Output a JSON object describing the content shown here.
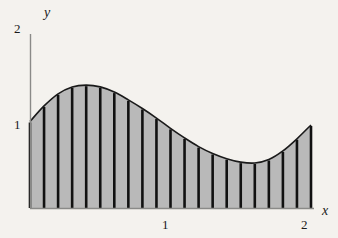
{
  "figure": {
    "background_color": "#f4f2ee",
    "axis_color": "#8a8a88",
    "curve_color": "#1a1a1a",
    "fill_color": "#b9b9b9",
    "strip_color": "#111111"
  },
  "axes": {
    "y_axis": {
      "variable_label": "y",
      "tick_labels": [
        "2",
        "1"
      ],
      "tick_values": [
        2,
        1
      ],
      "range": [
        0,
        2
      ]
    },
    "x_axis": {
      "variable_label": "x",
      "tick_labels": [
        "1",
        "2"
      ],
      "tick_values": [
        1,
        2
      ],
      "range": [
        0,
        2
      ]
    }
  },
  "chart_data": {
    "type": "area",
    "title": "",
    "subtitle": "",
    "xlabel": "x",
    "ylabel": "y",
    "xlim": [
      0,
      2
    ],
    "ylim": [
      0,
      2
    ],
    "grid": false,
    "legend": null,
    "annotations": [],
    "x_tick_labels": [
      "1",
      "2"
    ],
    "x_ticks": [
      1,
      2
    ],
    "y_tick_labels": [
      "1",
      "2"
    ],
    "y_ticks": [
      1,
      2
    ],
    "n_strips": 20,
    "strip_boundaries": [
      0.0,
      0.1,
      0.2,
      0.3,
      0.4,
      0.5,
      0.6,
      0.7,
      0.8,
      0.9,
      1.0,
      1.1,
      1.2,
      1.3,
      1.4,
      1.5,
      1.6,
      1.7,
      1.8,
      1.9,
      2.0
    ],
    "series": [
      {
        "name": "curve",
        "x": [
          0.0,
          0.1,
          0.2,
          0.3,
          0.4,
          0.5,
          0.6,
          0.7,
          0.8,
          0.9,
          1.0,
          1.1,
          1.2,
          1.3,
          1.4,
          1.5,
          1.6,
          1.7,
          1.8,
          1.9,
          2.0
        ],
        "values": [
          1.0,
          1.18,
          1.32,
          1.4,
          1.42,
          1.4,
          1.34,
          1.25,
          1.15,
          1.04,
          0.92,
          0.81,
          0.71,
          0.63,
          0.57,
          0.53,
          0.52,
          0.56,
          0.66,
          0.8,
          0.96
        ]
      }
    ],
    "strip_heights": [
      1.0,
      1.18,
      1.32,
      1.4,
      1.42,
      1.4,
      1.34,
      1.25,
      1.15,
      1.04,
      0.92,
      0.81,
      0.71,
      0.63,
      0.57,
      0.53,
      0.52,
      0.56,
      0.66,
      0.8,
      0.96
    ],
    "maximum": {
      "x": 0.4,
      "y": 1.42
    },
    "minimum": {
      "x": 1.6,
      "y": 0.52
    },
    "left_endpoint": {
      "x": 0.0,
      "y": 1.0
    },
    "right_endpoint": {
      "x": 2.0,
      "y": 0.96
    }
  }
}
